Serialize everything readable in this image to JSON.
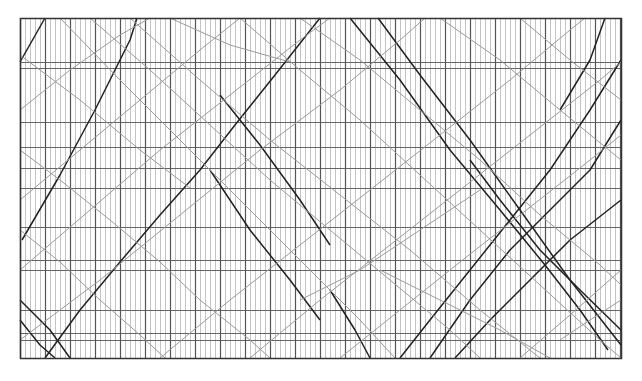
{
  "diagram": {
    "type": "train-timetable-time-distance-graph",
    "frame": {
      "x": 20,
      "y": 18,
      "width": 601,
      "height": 340
    },
    "colors": {
      "frame": "#333333",
      "minor_grid": "#b5b5b5",
      "major_grid": "#555555",
      "station_line": "#555555",
      "train_primary": "#222222",
      "train_secondary": "#9a9a9a"
    },
    "time_axis": {
      "minor_step_px": 5,
      "major_every": 5
    },
    "stations_y": [
      18,
      62,
      68,
      122,
      147,
      168,
      188,
      227,
      260,
      270,
      310,
      333,
      340,
      358
    ],
    "trains": [
      {
        "w": "primary",
        "pts": [
          [
            20,
            62
          ],
          [
            45,
            18
          ]
        ]
      },
      {
        "w": "primary",
        "pts": [
          [
            22,
            240
          ],
          [
            60,
            175
          ],
          [
            95,
            110
          ],
          [
            130,
            40
          ],
          [
            137,
            18
          ]
        ]
      },
      {
        "w": "primary",
        "pts": [
          [
            45,
            358
          ],
          [
            80,
            310
          ],
          [
            120,
            262
          ],
          [
            160,
            215
          ],
          [
            200,
            170
          ],
          [
            235,
            125
          ],
          [
            275,
            75
          ],
          [
            320,
            18
          ]
        ]
      },
      {
        "w": "primary",
        "pts": [
          [
            20,
            300
          ],
          [
            50,
            330
          ],
          [
            70,
            358
          ]
        ]
      },
      {
        "w": "primary",
        "pts": [
          [
            20,
            320
          ],
          [
            40,
            345
          ],
          [
            55,
            358
          ]
        ]
      },
      {
        "w": "primary",
        "pts": [
          [
            350,
            18
          ],
          [
            400,
            80
          ],
          [
            450,
            150
          ],
          [
            500,
            210
          ],
          [
            545,
            265
          ],
          [
            580,
            310
          ],
          [
            608,
            350
          ]
        ]
      },
      {
        "w": "primary",
        "pts": [
          [
            378,
            18
          ],
          [
            420,
            75
          ],
          [
            470,
            140
          ],
          [
            520,
            210
          ],
          [
            570,
            280
          ],
          [
            621,
            345
          ]
        ]
      },
      {
        "w": "primary",
        "pts": [
          [
            210,
            170
          ],
          [
            250,
            230
          ],
          [
            290,
            280
          ],
          [
            320,
            320
          ]
        ]
      },
      {
        "w": "primary",
        "pts": [
          [
            220,
            95
          ],
          [
            260,
            145
          ],
          [
            300,
            200
          ],
          [
            330,
            245
          ]
        ]
      },
      {
        "w": "primary",
        "pts": [
          [
            400,
            358
          ],
          [
            430,
            320
          ],
          [
            470,
            270
          ],
          [
            510,
            220
          ],
          [
            550,
            170
          ],
          [
            590,
            110
          ],
          [
            621,
            60
          ]
        ]
      },
      {
        "w": "primary",
        "pts": [
          [
            430,
            358
          ],
          [
            470,
            300
          ],
          [
            510,
            250
          ],
          [
            550,
            210
          ],
          [
            590,
            170
          ],
          [
            621,
            120
          ]
        ]
      },
      {
        "w": "primary",
        "pts": [
          [
            455,
            358
          ],
          [
            490,
            320
          ],
          [
            530,
            280
          ],
          [
            570,
            240
          ],
          [
            621,
            200
          ]
        ]
      },
      {
        "w": "primary",
        "pts": [
          [
            330,
            290
          ],
          [
            355,
            330
          ],
          [
            370,
            358
          ]
        ]
      },
      {
        "w": "primary",
        "pts": [
          [
            470,
            160
          ],
          [
            500,
            200
          ],
          [
            540,
            250
          ],
          [
            580,
            290
          ],
          [
            621,
            330
          ]
        ]
      },
      {
        "w": "primary",
        "pts": [
          [
            560,
            110
          ],
          [
            590,
            60
          ],
          [
            605,
            18
          ]
        ]
      },
      {
        "w": "secondary",
        "pts": [
          [
            60,
            18
          ],
          [
            120,
            80
          ],
          [
            180,
            140
          ],
          [
            240,
            200
          ],
          [
            300,
            260
          ],
          [
            360,
            320
          ],
          [
            395,
            358
          ]
        ]
      },
      {
        "w": "secondary",
        "pts": [
          [
            20,
            110
          ],
          [
            70,
            70
          ],
          [
            120,
            35
          ],
          [
            150,
            18
          ]
        ]
      },
      {
        "w": "secondary",
        "pts": [
          [
            20,
            200
          ],
          [
            80,
            150
          ],
          [
            140,
            100
          ],
          [
            200,
            50
          ],
          [
            240,
            18
          ]
        ]
      },
      {
        "w": "secondary",
        "pts": [
          [
            90,
            18
          ],
          [
            150,
            70
          ],
          [
            210,
            125
          ],
          [
            270,
            180
          ],
          [
            330,
            230
          ],
          [
            390,
            280
          ],
          [
            450,
            330
          ],
          [
            480,
            358
          ]
        ]
      },
      {
        "w": "secondary",
        "pts": [
          [
            20,
            270
          ],
          [
            90,
            210
          ],
          [
            160,
            150
          ],
          [
            230,
            95
          ],
          [
            300,
            40
          ],
          [
            330,
            18
          ]
        ]
      },
      {
        "w": "secondary",
        "pts": [
          [
            130,
            18
          ],
          [
            200,
            80
          ],
          [
            270,
            140
          ],
          [
            340,
            195
          ],
          [
            410,
            250
          ],
          [
            480,
            310
          ],
          [
            540,
            358
          ]
        ]
      },
      {
        "w": "secondary",
        "pts": [
          [
            20,
            340
          ],
          [
            100,
            280
          ],
          [
            180,
            215
          ],
          [
            260,
            150
          ],
          [
            340,
            90
          ],
          [
            400,
            40
          ],
          [
            425,
            18
          ]
        ]
      },
      {
        "w": "secondary",
        "pts": [
          [
            240,
            18
          ],
          [
            300,
            70
          ],
          [
            360,
            120
          ],
          [
            420,
            175
          ],
          [
            480,
            230
          ],
          [
            540,
            285
          ],
          [
            600,
            340
          ],
          [
            621,
            358
          ]
        ]
      },
      {
        "w": "secondary",
        "pts": [
          [
            300,
            18
          ],
          [
            360,
            60
          ],
          [
            420,
            110
          ],
          [
            480,
            160
          ],
          [
            540,
            215
          ],
          [
            600,
            265
          ],
          [
            621,
            285
          ]
        ]
      },
      {
        "w": "secondary",
        "pts": [
          [
            160,
            358
          ],
          [
            230,
            300
          ],
          [
            300,
            245
          ],
          [
            370,
            190
          ],
          [
            440,
            135
          ],
          [
            510,
            80
          ],
          [
            570,
            30
          ],
          [
            585,
            18
          ]
        ]
      },
      {
        "w": "secondary",
        "pts": [
          [
            250,
            358
          ],
          [
            320,
            300
          ],
          [
            390,
            245
          ],
          [
            460,
            190
          ],
          [
            530,
            135
          ],
          [
            600,
            80
          ],
          [
            621,
            62
          ]
        ]
      },
      {
        "w": "secondary",
        "pts": [
          [
            20,
            150
          ],
          [
            60,
            180
          ],
          [
            110,
            220
          ],
          [
            160,
            262
          ],
          [
            200,
            300
          ],
          [
            250,
            340
          ],
          [
            270,
            358
          ]
        ]
      },
      {
        "w": "secondary",
        "pts": [
          [
            20,
            230
          ],
          [
            60,
            262
          ],
          [
            100,
            300
          ],
          [
            140,
            335
          ],
          [
            165,
            358
          ]
        ]
      },
      {
        "w": "secondary",
        "pts": [
          [
            440,
            18
          ],
          [
            500,
            60
          ],
          [
            560,
            110
          ],
          [
            621,
            160
          ]
        ]
      },
      {
        "w": "secondary",
        "pts": [
          [
            520,
            18
          ],
          [
            570,
            60
          ],
          [
            621,
            100
          ]
        ]
      },
      {
        "w": "secondary",
        "pts": [
          [
            340,
            358
          ],
          [
            400,
            310
          ],
          [
            460,
            262
          ],
          [
            520,
            215
          ],
          [
            580,
            168
          ],
          [
            621,
            135
          ]
        ]
      },
      {
        "w": "secondary",
        "pts": [
          [
            520,
            358
          ],
          [
            570,
            315
          ],
          [
            621,
            270
          ]
        ]
      },
      {
        "w": "secondary",
        "pts": [
          [
            170,
            18
          ],
          [
            230,
            45
          ],
          [
            290,
            62
          ]
        ]
      },
      {
        "w": "secondary",
        "pts": [
          [
            20,
            55
          ],
          [
            80,
            100
          ],
          [
            140,
            150
          ],
          [
            190,
            188
          ]
        ]
      },
      {
        "w": "secondary",
        "pts": [
          [
            380,
            270
          ],
          [
            440,
            300
          ],
          [
            500,
            330
          ],
          [
            550,
            358
          ]
        ]
      },
      {
        "w": "secondary",
        "pts": [
          [
            300,
            300
          ],
          [
            360,
            270
          ],
          [
            420,
            230
          ],
          [
            480,
            190
          ]
        ]
      },
      {
        "w": "secondary",
        "pts": [
          [
            560,
            340
          ],
          [
            590,
            320
          ],
          [
            621,
            300
          ]
        ]
      }
    ]
  }
}
